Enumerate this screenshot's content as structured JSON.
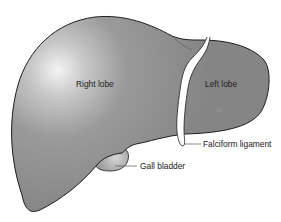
{
  "diagram": {
    "labels": {
      "right_lobe": "Right lobe",
      "left_lobe": "Left lobe",
      "falciform_ligament": "Falciform ligament",
      "gall_bladder": "Gall bladder"
    },
    "colors": {
      "liver_fill": "#8c8c8c",
      "liver_highlight": "#f2f2f2",
      "outline": "#1e1e1e",
      "ligament": "#ffffff",
      "gallbladder": "#a8a8a8",
      "leader_line": "#555555",
      "label_text": "#222222"
    }
  }
}
